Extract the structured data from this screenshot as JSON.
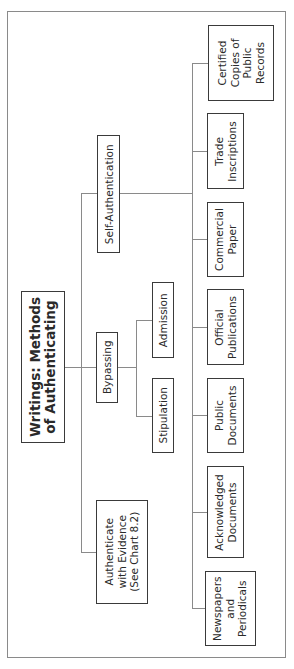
{
  "diagram": {
    "title": "Writings: Methods\nof Authenticating",
    "title_lines": [
      "Writings: Methods",
      "of Authenticating"
    ],
    "level1": [
      {
        "id": "self_auth",
        "lines": [
          "Self-Authentication"
        ]
      },
      {
        "id": "bypassing",
        "lines": [
          "Bypassing"
        ]
      },
      {
        "id": "authenticate",
        "lines": [
          "Authenticate",
          "with Evidence",
          "(See Chart 8.2)"
        ]
      }
    ],
    "bypassing_children": [
      {
        "id": "admission",
        "lines": [
          "Admission"
        ]
      },
      {
        "id": "stipulation",
        "lines": [
          "Stipulation"
        ]
      }
    ],
    "self_auth_children": [
      {
        "id": "certified",
        "lines": [
          "Certified",
          "Copies of",
          "Public",
          "Records"
        ]
      },
      {
        "id": "trade",
        "lines": [
          "Trade",
          "Inscriptions"
        ]
      },
      {
        "id": "commercial",
        "lines": [
          "Commercial",
          "Paper"
        ]
      },
      {
        "id": "official",
        "lines": [
          "Official",
          "Publications"
        ]
      },
      {
        "id": "public_docs",
        "lines": [
          "Public",
          "Documents"
        ]
      },
      {
        "id": "acknowledged",
        "lines": [
          "Acknowledged",
          "Documents"
        ]
      },
      {
        "id": "newspapers",
        "lines": [
          "Newspapers",
          "and",
          "Periodicals"
        ]
      }
    ],
    "colors": {
      "box_border": "#3a3a3a",
      "connector": "#8a8a8a",
      "frame": "#8a8a8a"
    }
  }
}
